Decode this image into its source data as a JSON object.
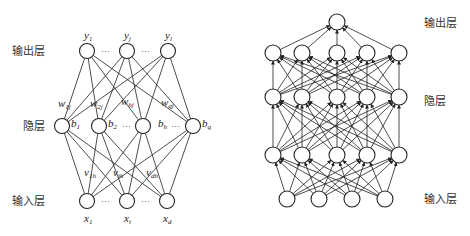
{
  "left_diagram": {
    "layer_labels": {
      "output": "输出层",
      "hidden": "隐层",
      "input": "输入层"
    },
    "output_nodes": [
      {
        "var": "y",
        "sub": "1",
        "x": 87,
        "y": 51
      },
      {
        "var": "y",
        "sub": "j",
        "x": 127,
        "y": 51
      },
      {
        "var": "y",
        "sub": "l",
        "x": 168,
        "y": 51
      }
    ],
    "hidden_nodes": [
      {
        "var": "b",
        "sub": "1",
        "x": 62,
        "y": 126
      },
      {
        "var": "b",
        "sub": "2",
        "x": 99,
        "y": 126
      },
      {
        "var": "b",
        "sub": "h",
        "x": 143,
        "y": 126
      },
      {
        "var": "b",
        "sub": "q",
        "x": 193,
        "y": 126
      }
    ],
    "input_nodes": [
      {
        "var": "x",
        "sub": "1",
        "x": 87,
        "y": 201
      },
      {
        "var": "x",
        "sub": "i",
        "x": 127,
        "y": 201
      },
      {
        "var": "x",
        "sub": "d",
        "x": 167,
        "y": 201
      }
    ],
    "weights_hidden_output": [
      {
        "var": "w",
        "sub": "1j"
      },
      {
        "var": "w",
        "sub": "2j"
      },
      {
        "var": "w",
        "sub": "hj"
      },
      {
        "var": "w",
        "sub": "qj"
      }
    ],
    "weights_input_hidden": [
      {
        "var": "v",
        "sub": "1h"
      },
      {
        "var": "v",
        "sub": "ih"
      },
      {
        "var": "v",
        "sub": "dh"
      }
    ],
    "ellipsis": "···"
  },
  "right_diagram": {
    "layer_labels": {
      "output": "输出层",
      "hidden": "隐层",
      "input": "输入层"
    },
    "layers": [
      {
        "name": "output",
        "y": 22,
        "xs": [
          337
        ]
      },
      {
        "name": "hidden-3",
        "y": 53,
        "xs": [
          273,
          302,
          337,
          367,
          399
        ]
      },
      {
        "name": "hidden-2",
        "y": 97,
        "xs": [
          273,
          302,
          337,
          367,
          399
        ]
      },
      {
        "name": "hidden-1",
        "y": 155,
        "xs": [
          273,
          302,
          337,
          367,
          399
        ]
      },
      {
        "name": "input",
        "y": 199,
        "xs": [
          287,
          319,
          352,
          385
        ]
      }
    ]
  }
}
